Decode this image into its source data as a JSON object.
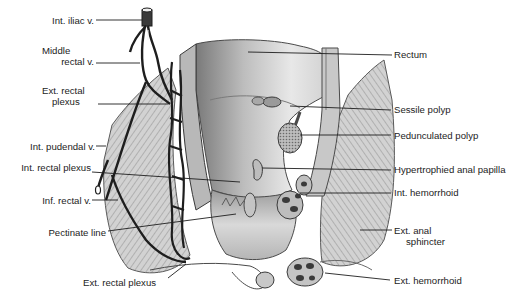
{
  "figure": {
    "left_labels": [
      {
        "id": "int-iliac-v",
        "text": "Int. iliac v."
      },
      {
        "id": "middle-rectal-v",
        "line1": "Middle",
        "line2": "rectal v."
      },
      {
        "id": "ext-rectal-plexus-upper",
        "line1": "Ext. rectal",
        "line2": "plexus"
      },
      {
        "id": "int-pudendal-v",
        "text": "Int. pudendal v."
      },
      {
        "id": "int-rectal-plexus",
        "text": "Int. rectal plexus"
      },
      {
        "id": "inf-rectal-v",
        "text": "Inf. rectal v."
      },
      {
        "id": "pectinate-line",
        "text": "Pectinate line"
      },
      {
        "id": "ext-rectal-plexus-lower",
        "text": "Ext. rectal plexus"
      }
    ],
    "right_labels": [
      {
        "id": "rectum",
        "text": "Rectum"
      },
      {
        "id": "sessile-polyp",
        "text": "Sessile polyp"
      },
      {
        "id": "pedunculated-polyp",
        "text": "Pedunculated polyp"
      },
      {
        "id": "hypertrophied-anal-papilla",
        "text": "Hypertrophied anal papilla"
      },
      {
        "id": "int-hemorrhoid",
        "text": "Int. hemorrhoid"
      },
      {
        "id": "ext-anal-sphincter",
        "line1": "Ext. anal",
        "line2": "sphincter"
      },
      {
        "id": "ext-hemorrhoid",
        "text": "Ext. hemorrhoid"
      }
    ],
    "colors": {
      "background": "#ffffff",
      "ink": "#1c1c1c",
      "vein": "#2a2a2a",
      "tissue_light": "#d6d6d6",
      "tissue_mid": "#a8a8a8",
      "tissue_dark": "#6e6e6e"
    }
  }
}
